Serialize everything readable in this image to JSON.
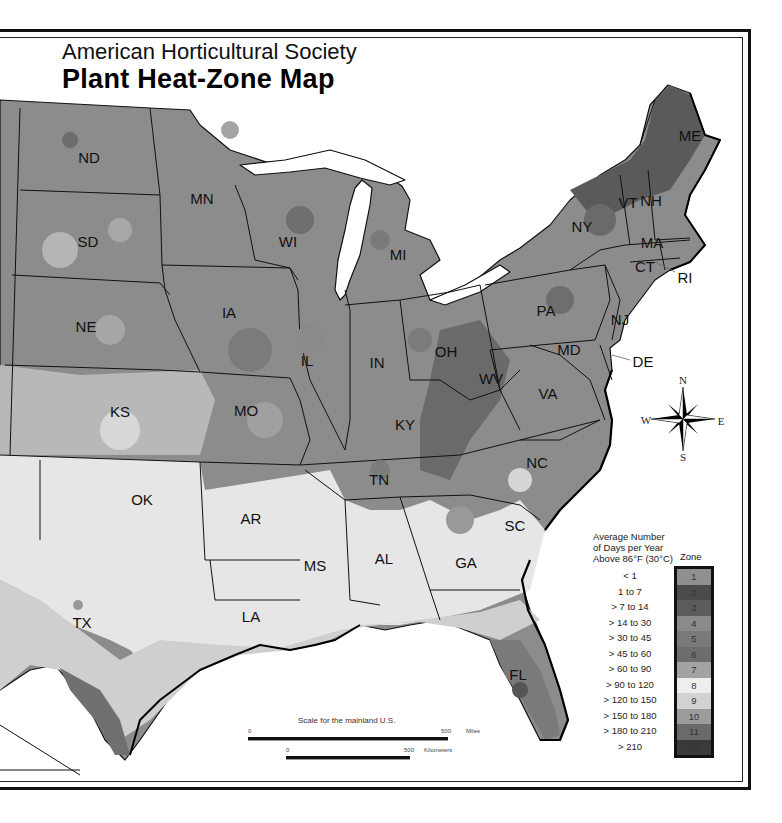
{
  "header": {
    "subtitle": "American Horticultural Society",
    "title": "Plant Heat-Zone Map"
  },
  "states": [
    {
      "abbr": "ND",
      "x": 89,
      "y": 157
    },
    {
      "abbr": "SD",
      "x": 88,
      "y": 241
    },
    {
      "abbr": "NE",
      "x": 86,
      "y": 326
    },
    {
      "abbr": "KS",
      "x": 120,
      "y": 411
    },
    {
      "abbr": "OK",
      "x": 142,
      "y": 499
    },
    {
      "abbr": "TX",
      "x": 82,
      "y": 622
    },
    {
      "abbr": "MN",
      "x": 202,
      "y": 198
    },
    {
      "abbr": "IA",
      "x": 229,
      "y": 312
    },
    {
      "abbr": "MO",
      "x": 246,
      "y": 410
    },
    {
      "abbr": "AR",
      "x": 251,
      "y": 518
    },
    {
      "abbr": "LA",
      "x": 251,
      "y": 616
    },
    {
      "abbr": "WI",
      "x": 288,
      "y": 241
    },
    {
      "abbr": "IL",
      "x": 307,
      "y": 360
    },
    {
      "abbr": "MI",
      "x": 398,
      "y": 254
    },
    {
      "abbr": "IN",
      "x": 377,
      "y": 362
    },
    {
      "abbr": "OH",
      "x": 446,
      "y": 351
    },
    {
      "abbr": "KY",
      "x": 405,
      "y": 424
    },
    {
      "abbr": "TN",
      "x": 379,
      "y": 479
    },
    {
      "abbr": "MS",
      "x": 315,
      "y": 565
    },
    {
      "abbr": "AL",
      "x": 384,
      "y": 558
    },
    {
      "abbr": "GA",
      "x": 466,
      "y": 562
    },
    {
      "abbr": "FL",
      "x": 518,
      "y": 674
    },
    {
      "abbr": "SC",
      "x": 515,
      "y": 525
    },
    {
      "abbr": "NC",
      "x": 537,
      "y": 462
    },
    {
      "abbr": "VA",
      "x": 548,
      "y": 393
    },
    {
      "abbr": "WV",
      "x": 491,
      "y": 378
    },
    {
      "abbr": "PA",
      "x": 546,
      "y": 310
    },
    {
      "abbr": "NY",
      "x": 582,
      "y": 226
    },
    {
      "abbr": "NJ",
      "x": 620,
      "y": 319
    },
    {
      "abbr": "MD",
      "x": 569,
      "y": 349
    },
    {
      "abbr": "DE",
      "x": 643,
      "y": 361
    },
    {
      "abbr": "VT",
      "x": 628,
      "y": 202
    },
    {
      "abbr": "NH",
      "x": 651,
      "y": 200
    },
    {
      "abbr": "MA",
      "x": 652,
      "y": 242
    },
    {
      "abbr": "CT",
      "x": 645,
      "y": 266
    },
    {
      "abbr": "RI",
      "x": 685,
      "y": 277
    },
    {
      "abbr": "ME",
      "x": 690,
      "y": 135
    }
  ],
  "compass": {
    "north": "N",
    "south": "S",
    "east": "E",
    "west": "W"
  },
  "legend": {
    "heading_line1": "Average Number",
    "heading_line2": "of Days per Year",
    "heading_line3": "Above 86°F (30°C)",
    "zone_heading": "Zone",
    "zones": [
      {
        "zone": "1",
        "range": "< 1",
        "color": "#8f8f8f"
      },
      {
        "zone": "2",
        "range": "1 to 7",
        "color": "#4a4a4a"
      },
      {
        "zone": "3",
        "range": "> 7 to 14",
        "color": "#5c5c5c"
      },
      {
        "zone": "4",
        "range": "> 14 to 30",
        "color": "#8a8a8a"
      },
      {
        "zone": "5",
        "range": "> 30 to 45",
        "color": "#7a7a7a"
      },
      {
        "zone": "6",
        "range": "> 45 to 60",
        "color": "#6d6d6d"
      },
      {
        "zone": "7",
        "range": "> 60 to 90",
        "color": "#a3a3a3"
      },
      {
        "zone": "8",
        "range": "> 90 to 120",
        "color": "#eeeeee"
      },
      {
        "zone": "9",
        "range": "> 120 to 150",
        "color": "#d2d2d2"
      },
      {
        "zone": "10",
        "range": "> 150 to 180",
        "color": "#9c9c9c"
      },
      {
        "zone": "11",
        "range": "> 180 to 210",
        "color": "#6a6a6a"
      },
      {
        "zone": "12",
        "range": "> 210",
        "color": "#3a3a3a"
      }
    ]
  },
  "scale": {
    "title": "Scale for the mainland U.S.",
    "miles_start": "0",
    "miles_end": "500",
    "miles_unit": "Miles",
    "km_start": "0",
    "km_end": "500",
    "km_unit": "Kilometers"
  }
}
